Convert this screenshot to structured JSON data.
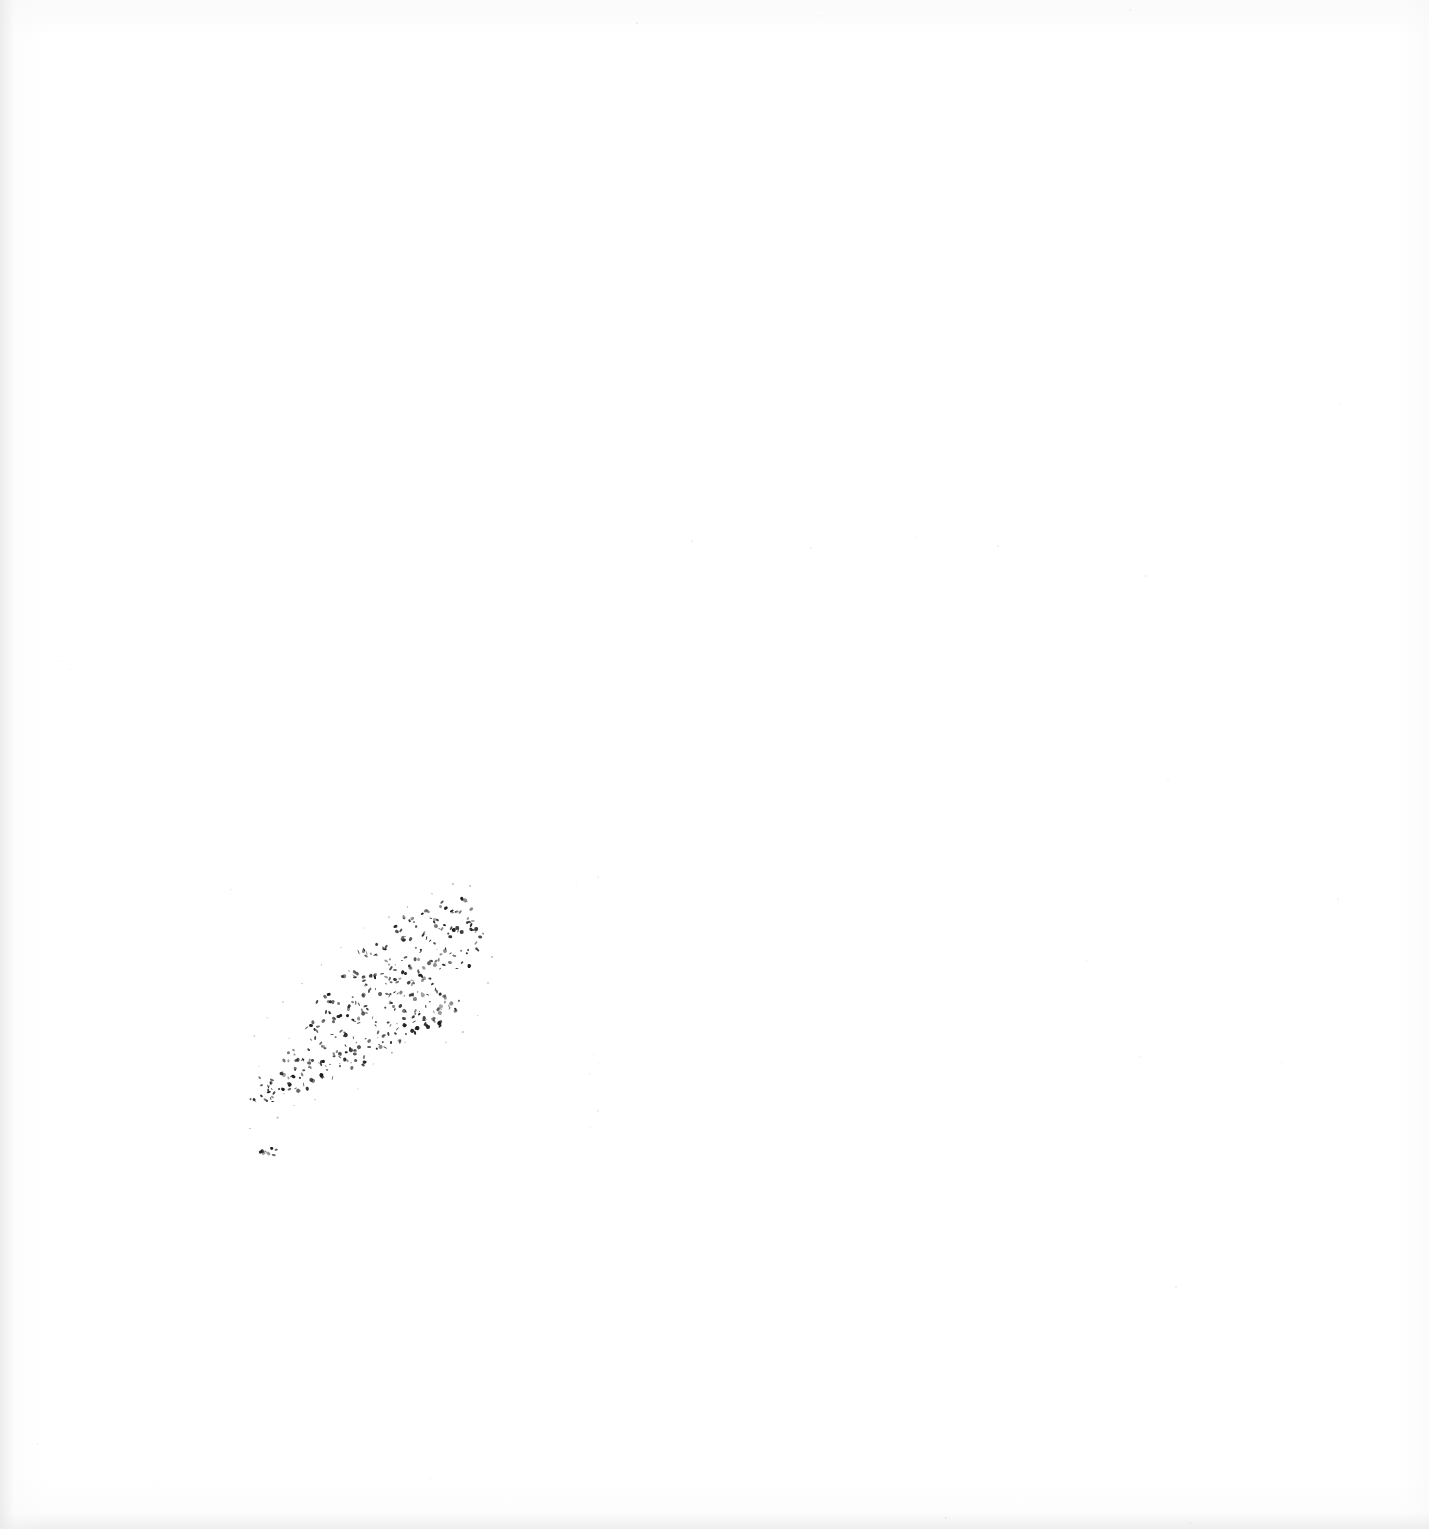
{
  "document": {
    "kind": "scanned-page",
    "page_text": "",
    "visible_text": "",
    "background_color": "#ffffff",
    "ink_color": "#1b1b1b",
    "canvas": {
      "width": 1429,
      "height": 1529
    }
  },
  "artifacts": {
    "primary": {
      "name": "diagonal-ink-smudge",
      "description": "faint broken diagonal streak of dark ink specks",
      "orientation": "lower-left to upper-right",
      "start": {
        "x": 250,
        "y": 1155
      },
      "end": {
        "x": 487,
        "y": 898
      },
      "densest_region": {
        "x": 300,
        "y": 930,
        "width": 170,
        "height": 160
      },
      "color": "#1b1b1b"
    },
    "edge_shading": {
      "name": "scanner-vignette",
      "edges": [
        "left",
        "bottom"
      ],
      "color": "#e9e9eb"
    }
  },
  "chart_data": {
    "type": "scatter",
    "title": "",
    "subtitle": "",
    "xlabel": "",
    "ylabel": "",
    "grid": false,
    "legend": null,
    "xlim": [
      0,
      1429
    ],
    "ylim": [
      0,
      1529
    ],
    "series": [
      {
        "name": "dense-smudge-core",
        "color": "#1b1b1b",
        "points": [
          [
            259,
            1148
          ],
          [
            264,
            1151
          ],
          [
            268,
            1147
          ],
          [
            273,
            1150
          ],
          [
            277,
            1146
          ],
          [
            251,
            1098
          ],
          [
            256,
            1101
          ],
          [
            261,
            1095
          ],
          [
            266,
            1099
          ],
          [
            270,
            1093
          ],
          [
            275,
            1097
          ],
          [
            280,
            1090
          ],
          [
            263,
            1085
          ],
          [
            268,
            1088
          ],
          [
            272,
            1082
          ],
          [
            258,
            1079
          ],
          [
            276,
            1086
          ],
          [
            285,
            1090
          ],
          [
            290,
            1084
          ],
          [
            296,
            1088
          ],
          [
            301,
            1081
          ],
          [
            307,
            1086
          ],
          [
            283,
            1073
          ],
          [
            289,
            1076
          ],
          [
            294,
            1070
          ],
          [
            300,
            1074
          ],
          [
            305,
            1068
          ],
          [
            312,
            1079
          ],
          [
            318,
            1073
          ],
          [
            323,
            1077
          ],
          [
            329,
            1070
          ],
          [
            334,
            1074
          ],
          [
            310,
            1062
          ],
          [
            316,
            1066
          ],
          [
            321,
            1059
          ],
          [
            327,
            1063
          ],
          [
            333,
            1057
          ],
          [
            296,
            1056
          ],
          [
            302,
            1060
          ],
          [
            290,
            1052
          ],
          [
            284,
            1057
          ],
          [
            338,
            1066
          ],
          [
            344,
            1060
          ],
          [
            349,
            1064
          ],
          [
            355,
            1057
          ],
          [
            360,
            1061
          ],
          [
            336,
            1049
          ],
          [
            342,
            1053
          ],
          [
            347,
            1046
          ],
          [
            353,
            1050
          ],
          [
            358,
            1044
          ],
          [
            318,
            1044
          ],
          [
            324,
            1048
          ],
          [
            312,
            1040
          ],
          [
            306,
            1045
          ],
          [
            364,
            1053
          ],
          [
            370,
            1047
          ],
          [
            375,
            1051
          ],
          [
            381,
            1044
          ],
          [
            386,
            1048
          ],
          [
            362,
            1036
          ],
          [
            368,
            1040
          ],
          [
            373,
            1033
          ],
          [
            379,
            1037
          ],
          [
            384,
            1031
          ],
          [
            344,
            1032
          ],
          [
            350,
            1036
          ],
          [
            338,
            1028
          ],
          [
            332,
            1033
          ],
          [
            390,
            1040
          ],
          [
            396,
            1034
          ],
          [
            401,
            1038
          ],
          [
            407,
            1031
          ],
          [
            412,
            1035
          ],
          [
            388,
            1023
          ],
          [
            394,
            1027
          ],
          [
            399,
            1020
          ],
          [
            405,
            1024
          ],
          [
            410,
            1018
          ],
          [
            370,
            1019
          ],
          [
            376,
            1023
          ],
          [
            364,
            1015
          ],
          [
            358,
            1020
          ],
          [
            416,
            1027
          ],
          [
            422,
            1021
          ],
          [
            427,
            1025
          ],
          [
            433,
            1018
          ],
          [
            438,
            1022
          ],
          [
            414,
            1010
          ],
          [
            420,
            1014
          ],
          [
            425,
            1007
          ],
          [
            431,
            1011
          ],
          [
            436,
            1005
          ],
          [
            396,
            1006
          ],
          [
            402,
            1010
          ],
          [
            390,
            1002
          ],
          [
            384,
            1007
          ],
          [
            346,
            1016
          ],
          [
            352,
            1020
          ],
          [
            340,
            1012
          ],
          [
            334,
            1017
          ],
          [
            328,
            1011
          ],
          [
            322,
            1022
          ],
          [
            316,
            1027
          ],
          [
            310,
            1021
          ],
          [
            304,
            1026
          ],
          [
            358,
            1003
          ],
          [
            364,
            1007
          ],
          [
            352,
            999
          ],
          [
            346,
            1004
          ],
          [
            330,
            998
          ],
          [
            336,
            1002
          ],
          [
            324,
            994
          ],
          [
            318,
            999
          ],
          [
            372,
            990
          ],
          [
            378,
            994
          ],
          [
            366,
            986
          ],
          [
            360,
            991
          ],
          [
            398,
            992
          ],
          [
            404,
            996
          ],
          [
            392,
            988
          ],
          [
            386,
            993
          ],
          [
            424,
            994
          ],
          [
            430,
            998
          ],
          [
            418,
            990
          ],
          [
            412,
            995
          ],
          [
            440,
            1009
          ],
          [
            446,
            1003
          ],
          [
            451,
            1007
          ],
          [
            457,
            1000
          ],
          [
            438,
            992
          ],
          [
            444,
            996
          ],
          [
            432,
            988
          ],
          [
            408,
            978
          ],
          [
            414,
            982
          ],
          [
            402,
            974
          ],
          [
            396,
            979
          ],
          [
            382,
            976
          ],
          [
            388,
            980
          ],
          [
            376,
            972
          ],
          [
            370,
            977
          ],
          [
            356,
            974
          ],
          [
            362,
            978
          ],
          [
            350,
            970
          ],
          [
            344,
            975
          ],
          [
            424,
            976
          ],
          [
            430,
            980
          ],
          [
            418,
            972
          ],
          [
            436,
            962
          ],
          [
            442,
            966
          ],
          [
            430,
            958
          ],
          [
            424,
            963
          ],
          [
            448,
            964
          ],
          [
            454,
            968
          ],
          [
            460,
            960
          ],
          [
            466,
            964
          ],
          [
            450,
            950
          ],
          [
            456,
            954
          ],
          [
            444,
            946
          ],
          [
            438,
            951
          ],
          [
            462,
            948
          ],
          [
            468,
            952
          ],
          [
            474,
            944
          ],
          [
            480,
            948
          ],
          [
            416,
            958
          ],
          [
            410,
            963
          ],
          [
            404,
            957
          ],
          [
            398,
            962
          ],
          [
            392,
            967
          ],
          [
            386,
            961
          ],
          [
            412,
            944
          ],
          [
            418,
            948
          ],
          [
            406,
            940
          ],
          [
            426,
            938
          ],
          [
            432,
            942
          ],
          [
            420,
            934
          ],
          [
            440,
            930
          ],
          [
            446,
            934
          ],
          [
            434,
            926
          ],
          [
            398,
            932
          ],
          [
            404,
            936
          ],
          [
            392,
            928
          ],
          [
            380,
            944
          ],
          [
            386,
            948
          ],
          [
            374,
            940
          ],
          [
            366,
            952
          ],
          [
            372,
            956
          ],
          [
            360,
            948
          ],
          [
            452,
            928
          ],
          [
            458,
            932
          ],
          [
            446,
            924
          ],
          [
            464,
            918
          ],
          [
            470,
            922
          ],
          [
            458,
            914
          ],
          [
            476,
            930
          ],
          [
            482,
            934
          ],
          [
            470,
            926
          ],
          [
            430,
            914
          ],
          [
            436,
            918
          ],
          [
            424,
            910
          ],
          [
            410,
            920
          ],
          [
            416,
            924
          ],
          [
            404,
            916
          ],
          [
            446,
            906
          ],
          [
            452,
            910
          ],
          [
            440,
            902
          ],
          [
            464,
            900
          ],
          [
            470,
            904
          ],
          [
            458,
            896
          ]
        ]
      },
      {
        "name": "sparse-halo-specks",
        "color": "#6d6d70",
        "points": [
          [
            249,
            1128
          ],
          [
            276,
            1117
          ],
          [
            292,
            1105
          ],
          [
            258,
            1066
          ],
          [
            288,
            1038
          ],
          [
            300,
            1090
          ],
          [
            314,
            1098
          ],
          [
            356,
            1088
          ],
          [
            372,
            1064
          ],
          [
            392,
            1052
          ],
          [
            404,
            1042
          ],
          [
            446,
            1042
          ],
          [
            462,
            1030
          ],
          [
            478,
            1014
          ],
          [
            488,
            982
          ],
          [
            492,
            956
          ],
          [
            470,
            886
          ],
          [
            452,
            884
          ],
          [
            430,
            892
          ],
          [
            406,
            906
          ],
          [
            388,
            916
          ],
          [
            364,
            928
          ],
          [
            340,
            946
          ],
          [
            320,
            964
          ],
          [
            300,
            982
          ],
          [
            282,
            1000
          ],
          [
            268,
            1018
          ],
          [
            254,
            1036
          ]
        ]
      },
      {
        "name": "detached-page-noise",
        "color": "#9a9a9d",
        "points": [
          [
            592,
            1054
          ],
          [
            598,
            1062
          ],
          [
            588,
            1074
          ],
          [
            596,
            1110
          ],
          [
            602,
            1118
          ],
          [
            590,
            1126
          ],
          [
            596,
            876
          ],
          [
            574,
            880
          ],
          [
            230,
            890
          ],
          [
            152,
            1056
          ],
          [
            36,
            580
          ],
          [
            62,
            660
          ],
          [
            70,
            668
          ],
          [
            98,
            672
          ],
          [
            110,
            676
          ],
          [
            546,
            610
          ],
          [
            558,
            616
          ],
          [
            690,
            540
          ],
          [
            746,
            540
          ],
          [
            862,
            540
          ],
          [
            914,
            536
          ],
          [
            996,
            544
          ],
          [
            1146,
            576
          ],
          [
            1168,
            780
          ],
          [
            1252,
            752
          ],
          [
            1258,
            784
          ],
          [
            1340,
            402
          ],
          [
            1336,
            898
          ],
          [
            1422,
            752
          ],
          [
            1086,
            960
          ],
          [
            1140,
            1056
          ],
          [
            1282,
            1062
          ],
          [
            1176,
            1286
          ],
          [
            810,
            546
          ],
          [
            636,
            22
          ],
          [
            646,
            44
          ],
          [
            818,
            16
          ],
          [
            1128,
            10
          ],
          [
            1190,
            1522
          ],
          [
            154,
            1484
          ],
          [
            36,
            1442
          ],
          [
            946,
            1516
          ],
          [
            430,
            1478
          ]
        ]
      }
    ]
  }
}
